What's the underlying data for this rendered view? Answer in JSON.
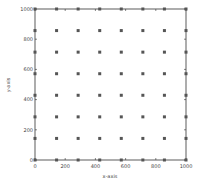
{
  "chart_data": {
    "type": "scatter",
    "title": "",
    "xlabel": "x-axis",
    "ylabel": "y-axis",
    "xlim": [
      0,
      1000
    ],
    "ylim": [
      0,
      1000
    ],
    "xticks": [
      0,
      200,
      400,
      600,
      800,
      1000
    ],
    "yticks": [
      0,
      200,
      400,
      600,
      800,
      1000
    ],
    "grid": false,
    "legend": null,
    "marker": "square",
    "marker_color": "#555555",
    "grid_points_per_axis": 8,
    "x_positions": [
      0,
      142.9,
      285.7,
      428.6,
      571.4,
      714.3,
      857.1,
      1000
    ],
    "y_positions": [
      0,
      142.9,
      285.7,
      428.6,
      571.4,
      714.3,
      857.1,
      1000
    ],
    "series": [
      {
        "name": "points",
        "description": "8x8 uniform grid of points (all combinations of x_positions and y_positions)"
      }
    ]
  },
  "colors": {
    "axis": "#333333",
    "marker": "#555555",
    "background": "#ffffff"
  }
}
